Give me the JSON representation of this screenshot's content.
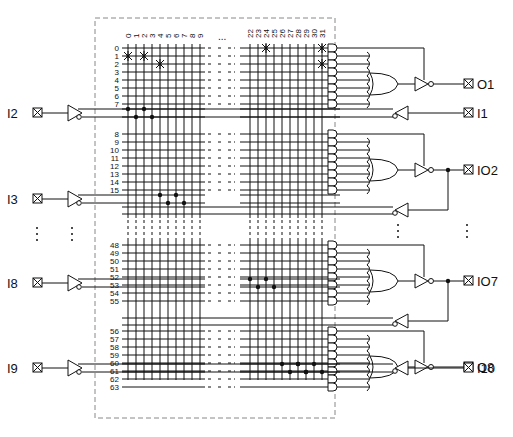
{
  "diagram": {
    "column_labels_left": [
      "0",
      "1",
      "2",
      "3",
      "4",
      "5",
      "6",
      "7",
      "8",
      "9"
    ],
    "column_labels_right": [
      "22",
      "23",
      "24",
      "25",
      "26",
      "27",
      "28",
      "29",
      "30",
      "31"
    ],
    "column_ellipsis": "...",
    "row_groups": [
      {
        "rows": [
          "0",
          "1",
          "2",
          "3",
          "4",
          "5",
          "6",
          "7"
        ],
        "output": "O1",
        "type": "output"
      },
      {
        "rows": [
          "8",
          "9",
          "10",
          "11",
          "12",
          "13",
          "14",
          "15"
        ],
        "output": "IO2",
        "type": "io"
      },
      {
        "rows": [
          "48",
          "49",
          "50",
          "51",
          "52",
          "53",
          "54",
          "55"
        ],
        "output": "IO7",
        "type": "io"
      },
      {
        "rows": [
          "56",
          "57",
          "58",
          "59",
          "60",
          "61",
          "62",
          "63"
        ],
        "output": "O8",
        "type": "output"
      }
    ],
    "left_inputs": [
      "I2",
      "I3",
      "I8",
      "I9"
    ],
    "right_inputs": [
      "I1",
      "I10"
    ],
    "outputs": [
      "O1",
      "IO2",
      "IO7",
      "O8"
    ],
    "fuse_marks": [
      {
        "row": 0,
        "col": 24
      },
      {
        "row": 0,
        "col": 31
      },
      {
        "row": 1,
        "col": 0
      },
      {
        "row": 1,
        "col": 2
      },
      {
        "row": 2,
        "col": 4
      },
      {
        "row": 2,
        "col": 31
      }
    ],
    "vertical_ellipsis": "⋮",
    "colors": {
      "line": "#111111",
      "dashed_box": "#888888",
      "background": "#ffffff"
    }
  }
}
